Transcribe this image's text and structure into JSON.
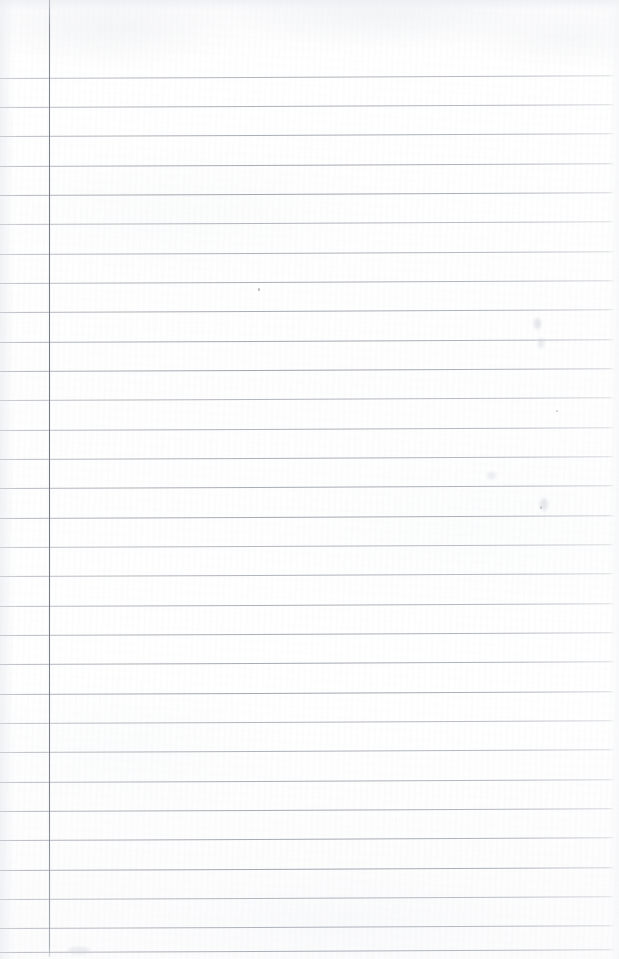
{
  "document": {
    "kind": "scanned-lined-notebook-page",
    "title": "Blank ruled notebook page",
    "content_text": "",
    "page_width": 619,
    "page_height": 959,
    "background_color": "#fdfdfd",
    "paper_tint": "#ffffff"
  },
  "ruling": {
    "line_color": "#989daa",
    "margin_line_color": "#767b87",
    "line_count": 30,
    "first_line_y": 78,
    "line_spacing": 29.3,
    "line_start_x": 0,
    "line_end_x": 614,
    "line_thickness": 1,
    "line_tilt_degrees": -0.25,
    "margin_line_x": 49,
    "margin_line_top": 0,
    "margin_line_bottom": 957,
    "lines": [
      {
        "index": 1,
        "y": 78
      },
      {
        "index": 2,
        "y": 107
      },
      {
        "index": 3,
        "y": 136
      },
      {
        "index": 4,
        "y": 166
      },
      {
        "index": 5,
        "y": 195
      },
      {
        "index": 6,
        "y": 224
      },
      {
        "index": 7,
        "y": 254
      },
      {
        "index": 8,
        "y": 283
      },
      {
        "index": 9,
        "y": 312
      },
      {
        "index": 10,
        "y": 342
      },
      {
        "index": 11,
        "y": 371
      },
      {
        "index": 12,
        "y": 400
      },
      {
        "index": 13,
        "y": 430
      },
      {
        "index": 14,
        "y": 459
      },
      {
        "index": 15,
        "y": 488
      },
      {
        "index": 16,
        "y": 518
      },
      {
        "index": 17,
        "y": 547
      },
      {
        "index": 18,
        "y": 576
      },
      {
        "index": 19,
        "y": 606
      },
      {
        "index": 20,
        "y": 635
      },
      {
        "index": 21,
        "y": 664
      },
      {
        "index": 22,
        "y": 694
      },
      {
        "index": 23,
        "y": 723
      },
      {
        "index": 24,
        "y": 752
      },
      {
        "index": 25,
        "y": 782
      },
      {
        "index": 26,
        "y": 811
      },
      {
        "index": 27,
        "y": 840
      },
      {
        "index": 28,
        "y": 870
      },
      {
        "index": 29,
        "y": 899
      },
      {
        "index": 30,
        "y": 928
      },
      {
        "index": 31,
        "y": 952
      }
    ]
  },
  "marks": {
    "specks": [
      {
        "name": "speck-upper-middle",
        "x": 258,
        "y": 288,
        "w": 2.2,
        "h": 3.4,
        "color": "rgba(120,124,133,0.55)"
      },
      {
        "name": "speck-right-upper",
        "x": 556,
        "y": 410,
        "w": 1.6,
        "h": 1.6,
        "color": "rgba(150,154,162,0.45)"
      },
      {
        "name": "speck-right-lower",
        "x": 540,
        "y": 506,
        "w": 1.8,
        "h": 2.6,
        "color": "rgba(146,150,158,0.45)"
      }
    ],
    "smudges": [
      {
        "name": "smudge-right-a",
        "x": 534,
        "y": 318,
        "w": 7,
        "h": 11,
        "color": "rgba(198,202,210,0.45)"
      },
      {
        "name": "smudge-right-b",
        "x": 538,
        "y": 338,
        "w": 6,
        "h": 10,
        "color": "rgba(200,204,212,0.40)"
      },
      {
        "name": "smudge-right-c",
        "x": 540,
        "y": 498,
        "w": 8,
        "h": 13,
        "color": "rgba(201,205,213,0.42)"
      },
      {
        "name": "smudge-right-d",
        "x": 487,
        "y": 472,
        "w": 9,
        "h": 7,
        "color": "rgba(206,210,217,0.35)"
      },
      {
        "name": "smudge-left-a",
        "x": 68,
        "y": 947,
        "w": 22,
        "h": 7,
        "color": "rgba(208,211,218,0.38)"
      }
    ]
  }
}
